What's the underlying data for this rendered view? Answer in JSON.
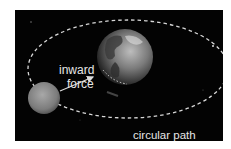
{
  "diagram": {
    "labels": {
      "inward_force_line1": "inward",
      "inward_force_line2": "force",
      "circular_path": "circular path"
    },
    "objects": [
      {
        "name": "Earth",
        "role": "central body"
      },
      {
        "name": "Moon",
        "role": "orbiting body"
      }
    ],
    "colors": {
      "background": "#030303",
      "orbit": "#d8d8d8",
      "text": "#e6e6e6",
      "arrow": "#dcdcdc"
    }
  }
}
